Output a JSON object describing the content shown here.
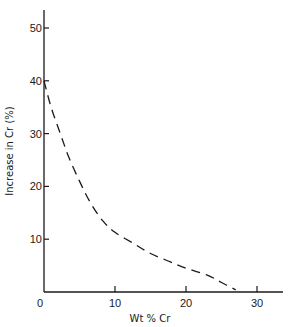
{
  "chart_data": {
    "type": "line",
    "title": "",
    "xlabel": "Wt % Cr",
    "ylabel": "Increase in Cr (%)",
    "xlim": [
      0,
      33
    ],
    "ylim": [
      0,
      53
    ],
    "xticks": [
      0,
      10,
      20,
      30
    ],
    "yticks": [
      10,
      20,
      30,
      40,
      50
    ],
    "xtick_labels": [
      "0",
      "10",
      "20",
      "30"
    ],
    "ytick_labels": [
      "10",
      "20",
      "30",
      "40",
      "50"
    ],
    "origin_label": "0",
    "grid": false,
    "legend": null,
    "series": [
      {
        "name": "Increase in Cr",
        "style": "dashed",
        "color": "#1a1a1a",
        "x": [
          0,
          1,
          2.3,
          3.5,
          5,
          6.5,
          8.2,
          10,
          12.6,
          15,
          17.8,
          20,
          23,
          25,
          27
        ],
        "y": [
          40,
          35,
          30,
          25.5,
          21,
          17,
          13.6,
          11.3,
          9.2,
          7.3,
          5.7,
          4.5,
          3.2,
          1.8,
          0.4
        ]
      }
    ]
  }
}
